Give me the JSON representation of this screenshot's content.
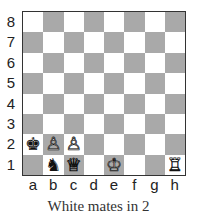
{
  "diagram": {
    "caption": "White mates in 2",
    "ranks": [
      "8",
      "7",
      "6",
      "5",
      "4",
      "3",
      "2",
      "1"
    ],
    "files": [
      "a",
      "b",
      "c",
      "d",
      "e",
      "f",
      "g",
      "h"
    ],
    "colors": {
      "light": "#ffffff",
      "dark": "#a9a9a9",
      "border": "#333333"
    },
    "pieces": [
      {
        "square": "a2",
        "color": "black",
        "type": "king",
        "glyph": "♚"
      },
      {
        "square": "b1",
        "color": "black",
        "type": "knight",
        "glyph": "♞"
      },
      {
        "square": "b2",
        "color": "white",
        "type": "pawn",
        "glyph": "♙"
      },
      {
        "square": "c2",
        "color": "white",
        "type": "pawn",
        "glyph": "♙"
      },
      {
        "square": "c1",
        "color": "white",
        "type": "queen",
        "glyph": "♕"
      },
      {
        "square": "e1",
        "color": "white",
        "type": "king",
        "glyph": "♔"
      },
      {
        "square": "h1",
        "color": "white",
        "type": "rook",
        "glyph": "♖"
      }
    ]
  }
}
